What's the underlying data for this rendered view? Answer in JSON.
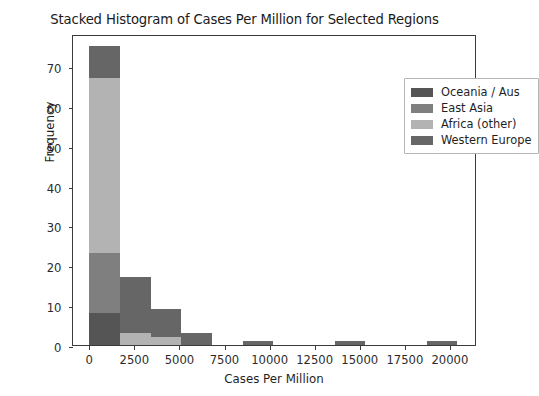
{
  "chart_data": {
    "type": "bar",
    "subtype": "stacked-histogram",
    "title": "Stacked Histogram of Cases Per Million for Selected Regions",
    "xlabel": "Cases Per Million",
    "ylabel": "Frequency",
    "xlim": [
      -900,
      21500
    ],
    "ylim": [
      0,
      78
    ],
    "grid": false,
    "legend_position": "upper right",
    "xticks": [
      0,
      2500,
      5000,
      7500,
      10000,
      12500,
      15000,
      17500,
      20000
    ],
    "xtick_labels": [
      "0",
      "2500",
      "5000",
      "7500",
      "10000",
      "12500",
      "15000",
      "17500",
      "20000"
    ],
    "yticks": [
      0,
      10,
      20,
      30,
      40,
      50,
      60,
      70
    ],
    "ytick_labels": [
      "0",
      "10",
      "20",
      "30",
      "40",
      "50",
      "60",
      "70"
    ],
    "bin_edges": [
      0,
      1700,
      3400,
      5100,
      6800,
      8500,
      10200,
      11900,
      13600,
      15300,
      17000,
      18700,
      20400
    ],
    "series": [
      {
        "name": "Oceania / Aus",
        "color": "#555555",
        "values": [
          8,
          0,
          0,
          0,
          0,
          0,
          0,
          0,
          0,
          0,
          0,
          0
        ]
      },
      {
        "name": "East Asia",
        "color": "#7f7f7f",
        "values": [
          15,
          0,
          0,
          0,
          0,
          0,
          0,
          0,
          0,
          0,
          0,
          0
        ]
      },
      {
        "name": "Africa (other)",
        "color": "#b3b3b3",
        "values": [
          44,
          3,
          2,
          0,
          0,
          0,
          0,
          0,
          0,
          0,
          0,
          0
        ]
      },
      {
        "name": "Western Europe",
        "color": "#666666",
        "values": [
          8,
          14,
          7,
          3,
          0,
          1,
          0,
          0,
          1,
          0,
          0,
          1
        ]
      }
    ],
    "bar_totals": [
      75,
      17,
      9,
      3,
      0,
      1,
      0,
      0,
      1,
      0,
      0,
      1
    ]
  },
  "legend": {
    "items": [
      {
        "label": "Oceania / Aus"
      },
      {
        "label": "East Asia"
      },
      {
        "label": "Africa (other)"
      },
      {
        "label": "Western Europe"
      }
    ]
  }
}
